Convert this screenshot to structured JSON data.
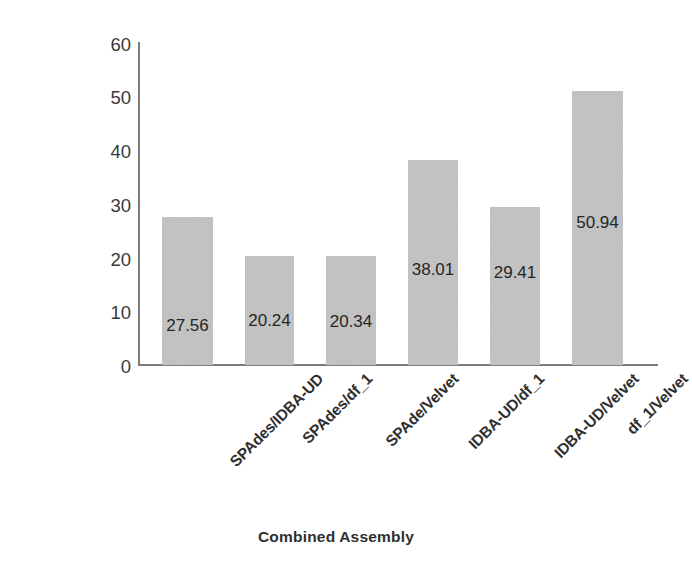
{
  "chart_data": {
    "type": "bar",
    "title": "",
    "xlabel": "Combined Assembly",
    "ylabel": "N50 Improvment %",
    "categories": [
      "SPAdes/IDBA-UD",
      "SPAdes/df_1",
      "SPAde/Velvet",
      "IDBA-UD/df_1",
      "IDBA-UD/Velvet",
      "df_1/Velvet"
    ],
    "values": [
      27.56,
      20.24,
      20.34,
      38.01,
      29.41,
      50.94
    ],
    "value_labels": [
      "27.56",
      "20.24",
      "20.34",
      "38.01",
      "29.41",
      "50.94"
    ],
    "ylim": [
      0,
      60
    ],
    "yticks": [
      60,
      50,
      40,
      30,
      20,
      10,
      0
    ],
    "ytick_labels": [
      "60",
      "50",
      "40",
      "30",
      "20",
      "10",
      "0"
    ],
    "grid": false,
    "legend": false,
    "bar_color": "#c4c4c4",
    "axis_color": "#7d7d7d",
    "text_color": "#2f2f2f",
    "background": "#ffffff"
  }
}
